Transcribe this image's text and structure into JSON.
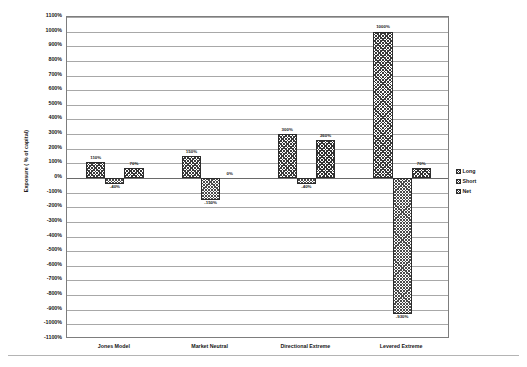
{
  "chart_data": {
    "type": "bar",
    "title": "",
    "subtitle": "",
    "xlabel": "",
    "ylabel": "Exposure ( % of capital)",
    "categories": [
      "Jones Model",
      "Market Neutral",
      "Directional Extreme",
      "Levered Extreme"
    ],
    "series": [
      {
        "name": "Long",
        "values": [
          110,
          150,
          300,
          1000
        ],
        "labels": [
          "110%",
          "150%",
          "300%",
          "1000%"
        ]
      },
      {
        "name": "Short",
        "values": [
          -40,
          -150,
          -40,
          -930
        ],
        "labels": [
          "-40%",
          "-150%",
          "-40%",
          "-930%"
        ]
      },
      {
        "name": "Net",
        "values": [
          70,
          0,
          260,
          70
        ],
        "labels": [
          "70%",
          "0%",
          "260%",
          "70%"
        ]
      }
    ],
    "ylim": [
      -1100,
      1100
    ],
    "ytick_step": 100,
    "ytick_labels": [
      "1100%",
      "1000%",
      "900%",
      "800%",
      "700%",
      "600%",
      "500%",
      "400%",
      "300%",
      "200%",
      "100%",
      "0%",
      "-100%",
      "-200%",
      "-300%",
      "-400%",
      "-500%",
      "-600%",
      "-700%",
      "-800%",
      "-900%",
      "-1000%",
      "-1100%"
    ],
    "grid": true,
    "grid_axis": "y",
    "legend_position": "right",
    "value_labels_shown": true,
    "bar_fill": "crosshatch",
    "colors": {
      "bar_outline": "#2c2c2c",
      "bar_hatch": "#3a3a3a",
      "gridline": "#a8a8a8",
      "plot_border": "#7d7d7d",
      "text": "#161616",
      "background": "#ffffff"
    }
  },
  "legend": {
    "items": [
      {
        "label": "Long"
      },
      {
        "label": "Short"
      },
      {
        "label": "Net"
      }
    ]
  }
}
